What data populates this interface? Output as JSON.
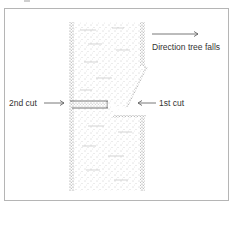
{
  "diagram": {
    "labels": {
      "direction": "Direction tree falls",
      "second_cut": "2nd cut",
      "first_cut": "1st cut"
    },
    "colors": {
      "border": "#b5b5b5",
      "stipple": "#8a8a8a",
      "text": "#333333",
      "arrow": "#555555"
    }
  }
}
